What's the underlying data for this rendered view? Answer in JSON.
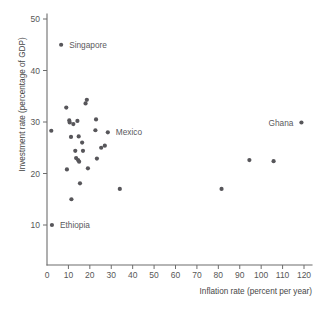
{
  "chart_data": {
    "type": "scatter",
    "title": "",
    "xlabel": "Inflation rate (percent per year)",
    "ylabel": "Investment rate (percentage of GDP)",
    "xlim": [
      0,
      124
    ],
    "ylim": [
      5,
      51
    ],
    "xticks": [
      0,
      10,
      20,
      30,
      40,
      50,
      60,
      70,
      80,
      90,
      100,
      110,
      120
    ],
    "yticks": [
      10,
      20,
      30,
      40,
      50
    ],
    "grid": false,
    "legend": "none",
    "marker_color": "#57565a",
    "axis_color": "#6d6d6d",
    "points": [
      {
        "x": 2.0,
        "y": 28.3,
        "label": ""
      },
      {
        "x": 2.3,
        "y": 10.0,
        "label": "Ethiopia"
      },
      {
        "x": 6.6,
        "y": 45.0,
        "label": "Singapore"
      },
      {
        "x": 9.0,
        "y": 32.8,
        "label": ""
      },
      {
        "x": 9.3,
        "y": 20.8,
        "label": ""
      },
      {
        "x": 10.4,
        "y": 30.3,
        "label": ""
      },
      {
        "x": 10.6,
        "y": 29.9,
        "label": ""
      },
      {
        "x": 11.2,
        "y": 27.1,
        "label": ""
      },
      {
        "x": 11.4,
        "y": 15.0,
        "label": ""
      },
      {
        "x": 12.3,
        "y": 29.6,
        "label": ""
      },
      {
        "x": 13.2,
        "y": 24.4,
        "label": ""
      },
      {
        "x": 13.6,
        "y": 23.0,
        "label": ""
      },
      {
        "x": 14.2,
        "y": 30.2,
        "label": ""
      },
      {
        "x": 14.5,
        "y": 22.6,
        "label": ""
      },
      {
        "x": 14.8,
        "y": 27.2,
        "label": ""
      },
      {
        "x": 15.0,
        "y": 22.3,
        "label": ""
      },
      {
        "x": 15.4,
        "y": 18.1,
        "label": ""
      },
      {
        "x": 16.4,
        "y": 26.0,
        "label": ""
      },
      {
        "x": 16.8,
        "y": 24.4,
        "label": ""
      },
      {
        "x": 18.0,
        "y": 33.6,
        "label": ""
      },
      {
        "x": 18.6,
        "y": 34.3,
        "label": ""
      },
      {
        "x": 19.1,
        "y": 21.0,
        "label": ""
      },
      {
        "x": 22.6,
        "y": 28.4,
        "label": ""
      },
      {
        "x": 22.9,
        "y": 30.5,
        "label": ""
      },
      {
        "x": 23.3,
        "y": 22.9,
        "label": ""
      },
      {
        "x": 25.3,
        "y": 25.0,
        "label": ""
      },
      {
        "x": 27.0,
        "y": 25.4,
        "label": ""
      },
      {
        "x": 28.4,
        "y": 28.0,
        "label": "Mexico"
      },
      {
        "x": 34.0,
        "y": 17.0,
        "label": ""
      },
      {
        "x": 81.5,
        "y": 17.0,
        "label": ""
      },
      {
        "x": 94.5,
        "y": 22.6,
        "label": ""
      },
      {
        "x": 105.8,
        "y": 22.4,
        "label": ""
      },
      {
        "x": 118.8,
        "y": 29.9,
        "label": "Ghana"
      }
    ],
    "annotations": [
      {
        "name": "singapore",
        "text": "Singapore",
        "x": 6.6,
        "y": 45.0,
        "side": "right"
      },
      {
        "name": "mexico",
        "text": "Mexico",
        "x": 28.4,
        "y": 28.0,
        "side": "right"
      },
      {
        "name": "ghana",
        "text": "Ghana",
        "x": 118.8,
        "y": 29.9,
        "side": "left"
      },
      {
        "name": "ethiopia",
        "text": "Ethiopia",
        "x": 2.3,
        "y": 10.0,
        "side": "right"
      }
    ]
  }
}
